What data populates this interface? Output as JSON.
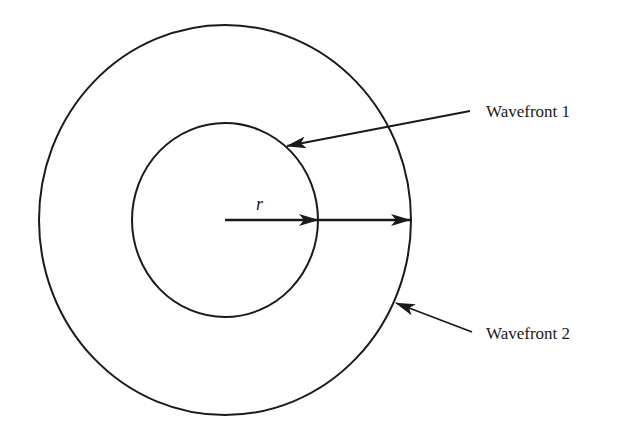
{
  "diagram": {
    "title": "",
    "radius_label": "r",
    "wavefronts": [
      {
        "label": "Wavefront 1",
        "cx": 225,
        "cy": 220,
        "rx": 93,
        "ry": 98
      },
      {
        "label": "Wavefront 2",
        "cx": 225,
        "cy": 220,
        "rx": 186,
        "ry": 195
      }
    ],
    "stroke_color": "#1a1a1a",
    "background": "#ffffff"
  }
}
